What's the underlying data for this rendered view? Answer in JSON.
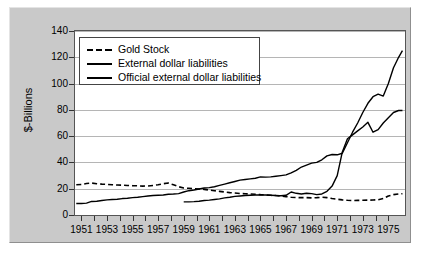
{
  "chart_data": {
    "type": "line",
    "title": "",
    "xlabel": "",
    "ylabel": "$-Billions",
    "xlim": [
      1950.5,
      1976.3
    ],
    "ylim": [
      0,
      140
    ],
    "yticks": [
      0,
      20,
      40,
      60,
      80,
      100,
      120,
      140
    ],
    "xticks": [
      1951,
      1952,
      1953,
      1954,
      1955,
      1956,
      1957,
      1958,
      1959,
      1960,
      1961,
      1962,
      1963,
      1964,
      1965,
      1966,
      1967,
      1968,
      1969,
      1970,
      1971,
      1972,
      1973,
      1974,
      1975
    ],
    "xtick_labels": [
      "1951",
      "1953",
      "1955",
      "1957",
      "1959",
      "1961",
      "1963",
      "1965",
      "1967",
      "1969",
      "1971",
      "1973",
      "1975"
    ],
    "xtick_label_years": [
      1951,
      1953,
      1955,
      1957,
      1959,
      1961,
      1963,
      1965,
      1967,
      1969,
      1971,
      1973,
      1975
    ],
    "grid": "horizontal",
    "legend_position": "upper-left",
    "series": [
      {
        "name": "Gold Stock",
        "style": "dashed",
        "color": "#000000",
        "x": [
          1950.6,
          1951.0,
          1951.4,
          1951.8,
          1952.2,
          1952.6,
          1953.0,
          1953.4,
          1953.8,
          1954.2,
          1954.6,
          1955.0,
          1955.4,
          1955.8,
          1956.2,
          1956.6,
          1957.0,
          1957.4,
          1957.8,
          1958.2,
          1958.6,
          1959.0,
          1959.4,
          1959.8,
          1960.2,
          1960.6,
          1961.0,
          1961.4,
          1961.8,
          1962.2,
          1962.6,
          1963.0,
          1963.4,
          1963.8,
          1964.2,
          1964.6,
          1965.0,
          1965.4,
          1965.8,
          1966.2,
          1966.6,
          1967.0,
          1967.4,
          1967.8,
          1968.2,
          1968.6,
          1969.0,
          1969.4,
          1969.8,
          1970.2,
          1970.6,
          1971.0,
          1971.4,
          1971.8,
          1972.2,
          1972.6,
          1973.0,
          1973.4,
          1973.8,
          1974.2,
          1974.6,
          1975.0,
          1975.4,
          1975.8,
          1976.1
        ],
        "y": [
          23.0,
          23.2,
          24.0,
          24.3,
          23.8,
          23.5,
          23.3,
          23.0,
          22.8,
          22.7,
          22.5,
          22.3,
          22.2,
          22.0,
          22.1,
          22.5,
          23.0,
          23.8,
          24.3,
          23.0,
          21.5,
          20.5,
          20.3,
          20.0,
          19.8,
          19.5,
          19.0,
          18.5,
          18.0,
          17.5,
          17.0,
          16.7,
          16.4,
          16.2,
          16.0,
          15.8,
          15.5,
          15.3,
          15.0,
          14.8,
          14.5,
          14.0,
          13.5,
          13.3,
          13.2,
          13.2,
          13.0,
          13.2,
          13.5,
          13.2,
          12.5,
          12.0,
          11.5,
          11.2,
          11.0,
          11.1,
          11.2,
          11.3,
          11.4,
          11.6,
          12.5,
          14.5,
          15.5,
          16.0,
          16.2
        ]
      },
      {
        "name": "External dollar liabilities",
        "style": "solid",
        "color": "#000000",
        "x": [
          1950.6,
          1951.0,
          1951.4,
          1951.8,
          1952.2,
          1952.6,
          1953.0,
          1953.4,
          1953.8,
          1954.2,
          1954.6,
          1955.0,
          1955.4,
          1955.8,
          1956.2,
          1956.6,
          1957.0,
          1957.4,
          1957.8,
          1958.2,
          1958.6,
          1959.0,
          1959.4,
          1959.8,
          1960.2,
          1960.6,
          1961.0,
          1961.4,
          1961.8,
          1962.2,
          1962.6,
          1963.0,
          1963.4,
          1963.8,
          1964.2,
          1964.6,
          1965.0,
          1965.4,
          1965.8,
          1966.2,
          1966.6,
          1967.0,
          1967.4,
          1967.8,
          1968.2,
          1968.6,
          1969.0,
          1969.4,
          1969.8,
          1970.2,
          1970.6,
          1971.0,
          1971.4,
          1971.8,
          1972.2,
          1972.6,
          1973.0,
          1973.4,
          1973.8,
          1974.2,
          1974.6,
          1975.0,
          1975.4,
          1975.8,
          1976.1
        ],
        "y": [
          8.8,
          8.8,
          9.0,
          10.3,
          10.5,
          11.0,
          11.5,
          11.8,
          12.0,
          12.5,
          12.8,
          13.2,
          13.5,
          14.0,
          14.5,
          14.8,
          15.0,
          15.2,
          15.8,
          16.0,
          16.3,
          17.5,
          18.5,
          19.0,
          19.8,
          20.5,
          20.8,
          21.5,
          22.5,
          23.5,
          24.5,
          25.5,
          26.5,
          27.0,
          27.5,
          28.0,
          29.0,
          28.8,
          29.0,
          29.5,
          30.0,
          30.5,
          32.0,
          34.0,
          36.5,
          38.0,
          39.5,
          40.0,
          42.0,
          45.0,
          46.0,
          45.8,
          47.0,
          55.0,
          63.0,
          70.0,
          78.0,
          85.0,
          90.0,
          92.0,
          90.5,
          100.0,
          112.0,
          120.0,
          125.0
        ]
      },
      {
        "name": "Official external dollar liabilities",
        "style": "solid",
        "color": "#000000",
        "x": [
          1959.0,
          1959.4,
          1959.8,
          1960.2,
          1960.6,
          1961.0,
          1961.4,
          1961.8,
          1962.2,
          1962.6,
          1963.0,
          1963.4,
          1963.8,
          1964.2,
          1964.6,
          1965.0,
          1965.4,
          1965.8,
          1966.2,
          1966.6,
          1967.0,
          1967.4,
          1967.8,
          1968.2,
          1968.6,
          1969.0,
          1969.4,
          1969.8,
          1970.2,
          1970.6,
          1971.0,
          1971.4,
          1971.8,
          1972.2,
          1972.6,
          1973.0,
          1973.4,
          1973.8,
          1974.2,
          1974.6,
          1975.0,
          1975.4,
          1975.8,
          1976.1
        ],
        "y": [
          10.0,
          10.0,
          10.2,
          10.5,
          11.0,
          11.3,
          11.8,
          12.3,
          13.0,
          13.5,
          14.2,
          14.5,
          14.8,
          15.0,
          15.2,
          15.3,
          15.2,
          15.0,
          14.8,
          14.7,
          15.0,
          17.5,
          16.5,
          16.0,
          16.5,
          16.3,
          15.5,
          16.0,
          18.0,
          22.0,
          30.0,
          48.0,
          58.0,
          61.0,
          64.0,
          67.0,
          70.5,
          63.0,
          65.0,
          70.0,
          74.0,
          78.0,
          79.5,
          79.5
        ]
      }
    ]
  },
  "axis": {
    "ylabel": "$-Billions"
  }
}
